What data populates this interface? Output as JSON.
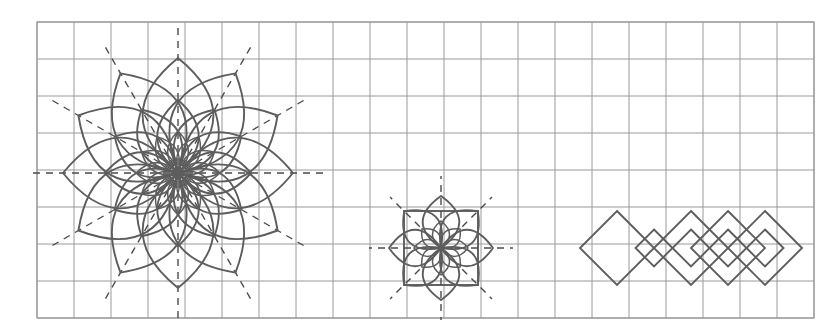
{
  "page": {
    "width": 832,
    "height": 334,
    "background_color": "#ffffff"
  },
  "grid": {
    "name": "square-grid",
    "origin_x": 37,
    "origin_y": 22,
    "cell_size": 37,
    "columns": 21,
    "rows": 8,
    "line_color": "#9a9a9a",
    "line_width": 1,
    "border_color": "#9a9a9a",
    "border_width": 1.2
  },
  "style": {
    "stroke_color": "#5d5d5d",
    "stroke_color_dark": "#4a4a4a",
    "stroke_width_main": 1.9,
    "stroke_width_thin": 1.5,
    "dash_color": "#4a4a4a",
    "dash_width": 1.4,
    "dash_pattern": "7,6",
    "fill": "none"
  },
  "figures": [
    {
      "id": "large-rosette",
      "name": "large-rosette",
      "type": "rosette",
      "center_x": 178,
      "center_y": 173,
      "petal_count": 12,
      "angle_step_degrees": 30,
      "rings": [
        {
          "ring": "outer",
          "petal_length": 115,
          "petal_width": 58
        },
        {
          "ring": "middle",
          "petal_length": 73,
          "petal_width": 34
        },
        {
          "ring": "inner",
          "petal_length": 42,
          "petal_width": 17
        }
      ],
      "radial_dashed_lines": {
        "count": 12,
        "inner_radius": 8,
        "outer_radius": 148
      }
    },
    {
      "id": "small-rosette",
      "name": "small-rosette",
      "type": "rosette",
      "center_x": 441,
      "center_y": 248,
      "petal_count": 8,
      "angle_step_degrees": 45,
      "rings": [
        {
          "ring": "outer",
          "petal_length": 52,
          "petal_width": 30
        },
        {
          "ring": "inner",
          "petal_length": 27,
          "petal_width": 14
        }
      ],
      "bounding_square": {
        "x": 404,
        "y": 211,
        "size": 74
      },
      "radial_dashed_lines": {
        "count": 8,
        "inner_radius": 4,
        "outer_radius": 72
      }
    },
    {
      "id": "diamond-band",
      "name": "diamond-band",
      "type": "diamond-lattice",
      "axis_y": 248,
      "large_diamonds": {
        "count": 4,
        "half_width": 37,
        "half_height": 37,
        "center_x_values": [
          617,
          691,
          765,
          728
        ]
      },
      "small_diamonds": {
        "count": 4,
        "half_width": 18.5,
        "half_height": 18.5,
        "center_x_values": [
          654,
          691,
          728,
          765
        ]
      }
    }
  ]
}
